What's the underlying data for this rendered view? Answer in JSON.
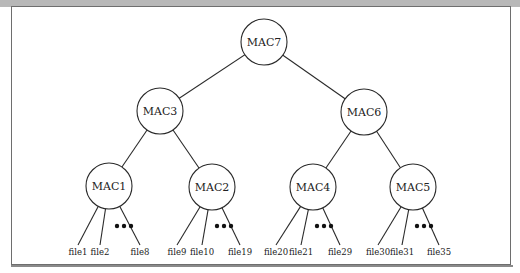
{
  "diagram": {
    "title": "",
    "type": "merkle-tree",
    "node_radius": 23,
    "nodes": [
      {
        "id": "MAC7",
        "label": "MAC7",
        "x": 264,
        "y": 42,
        "parent": null
      },
      {
        "id": "MAC3",
        "label": "MAC3",
        "x": 160,
        "y": 111,
        "parent": "MAC7"
      },
      {
        "id": "MAC6",
        "label": "MAC6",
        "x": 364,
        "y": 112,
        "parent": "MAC7"
      },
      {
        "id": "MAC1",
        "label": "MAC1",
        "x": 109,
        "y": 186,
        "parent": "MAC3"
      },
      {
        "id": "MAC2",
        "label": "MAC2",
        "x": 212,
        "y": 187,
        "parent": "MAC3"
      },
      {
        "id": "MAC4",
        "label": "MAC4",
        "x": 313,
        "y": 187,
        "parent": "MAC6"
      },
      {
        "id": "MAC5",
        "label": "MAC5",
        "x": 413,
        "y": 187,
        "parent": "MAC6"
      }
    ],
    "leaf_groups": [
      {
        "parent": "MAC1",
        "leaves": [
          {
            "label": "file1",
            "x": 78,
            "y": 255
          },
          {
            "label": "file2",
            "x": 100,
            "y": 255
          },
          {
            "label": "file8",
            "x": 140,
            "y": 255
          }
        ],
        "ellipsis": {
          "x": 124,
          "y": 226
        }
      },
      {
        "parent": "MAC2",
        "leaves": [
          {
            "label": "file9",
            "x": 177,
            "y": 255
          },
          {
            "label": "file10",
            "x": 202,
            "y": 255
          },
          {
            "label": "file19",
            "x": 240,
            "y": 255
          }
        ],
        "ellipsis": {
          "x": 224,
          "y": 226
        }
      },
      {
        "parent": "MAC4",
        "leaves": [
          {
            "label": "file20",
            "x": 276,
            "y": 255
          },
          {
            "label": "file21",
            "x": 301,
            "y": 255
          },
          {
            "label": "file29",
            "x": 340,
            "y": 255
          }
        ],
        "ellipsis": {
          "x": 324,
          "y": 226
        }
      },
      {
        "parent": "MAC5",
        "leaves": [
          {
            "label": "file30",
            "x": 378,
            "y": 255
          },
          {
            "label": "file31",
            "x": 402,
            "y": 255
          },
          {
            "label": "file35",
            "x": 439,
            "y": 255
          }
        ],
        "ellipsis": {
          "x": 424,
          "y": 226
        }
      }
    ],
    "ellipsis_symbol": "•••",
    "colors": {
      "stroke": "#2a2a2a",
      "frame": "#6e6e6e",
      "top_band": "#b8b8b8",
      "background": "#ffffff"
    }
  }
}
